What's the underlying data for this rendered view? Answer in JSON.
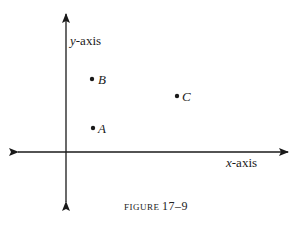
{
  "figure": {
    "caption_word": "FIGURE",
    "caption_number": "17–9"
  },
  "axes": {
    "x_label_var": "x",
    "x_label_rest": "-axis",
    "y_label_var": "y",
    "y_label_rest": "-axis"
  },
  "points": [
    {
      "name": "B"
    },
    {
      "name": "A"
    },
    {
      "name": "C"
    }
  ],
  "colors": {
    "ink": "#1a1a1a"
  }
}
